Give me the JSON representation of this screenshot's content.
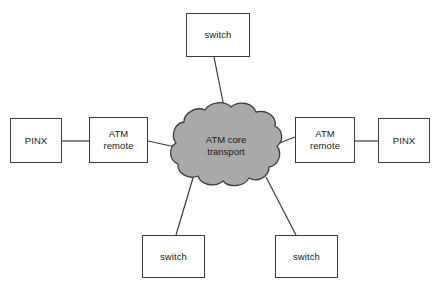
{
  "diagram": {
    "background_color": "#ffffff",
    "line_color": "#3a3a3a",
    "box_fill": "#ffffff",
    "cloud_fill": "#a9a9a9",
    "cloud_stroke": "#3c3c3c",
    "text_color": "#1a1a1a",
    "cloud": {
      "label": "ATM core\ntransport",
      "name": "atm-core-transport-cloud"
    },
    "nodes": [
      {
        "id": "switch-top",
        "label": "switch",
        "x": 186,
        "y": 13,
        "w": 64,
        "h": 44
      },
      {
        "id": "pinx-left",
        "label": "PINX",
        "x": 10,
        "y": 118,
        "w": 52,
        "h": 45
      },
      {
        "id": "atm-remote-left",
        "label": "ATM\nremote",
        "x": 89,
        "y": 117,
        "w": 59,
        "h": 46
      },
      {
        "id": "atm-remote-right",
        "label": "ATM\nremote",
        "x": 295,
        "y": 117,
        "w": 60,
        "h": 46
      },
      {
        "id": "pinx-right",
        "label": "PINX",
        "x": 378,
        "y": 118,
        "w": 52,
        "h": 45
      },
      {
        "id": "switch-bottom-left",
        "label": "switch",
        "x": 142,
        "y": 235,
        "w": 63,
        "h": 43
      },
      {
        "id": "switch-bottom-right",
        "label": "switch",
        "x": 275,
        "y": 235,
        "w": 63,
        "h": 43
      }
    ],
    "edges": [
      {
        "id": "edge-pinx-left-to-atm-remote-left",
        "from": "pinx-left",
        "to": "atm-remote-left",
        "x1": 62,
        "y1": 141,
        "x2": 89,
        "y2": 141
      },
      {
        "id": "edge-atm-remote-left-to-cloud",
        "from": "atm-remote-left",
        "to": "cloud",
        "x1": 148,
        "y1": 141,
        "x2": 180,
        "y2": 148
      },
      {
        "id": "edge-cloud-to-atm-remote-right",
        "from": "cloud",
        "to": "atm-remote-right",
        "x1": 272,
        "y1": 146,
        "x2": 295,
        "y2": 137
      },
      {
        "id": "edge-atm-remote-right-to-pinx-right",
        "from": "atm-remote-right",
        "to": "pinx-right",
        "x1": 355,
        "y1": 141,
        "x2": 378,
        "y2": 141
      },
      {
        "id": "edge-switch-top-to-cloud",
        "from": "switch-top",
        "to": "cloud",
        "x1": 214,
        "y1": 57,
        "x2": 226,
        "y2": 117
      },
      {
        "id": "edge-cloud-to-switch-bottom-left",
        "from": "cloud",
        "to": "switch-bottom-left",
        "x1": 193,
        "y1": 178,
        "x2": 176,
        "y2": 235
      },
      {
        "id": "edge-cloud-to-switch-bottom-right",
        "from": "cloud",
        "to": "switch-bottom-right",
        "x1": 266,
        "y1": 177,
        "x2": 296,
        "y2": 235
      }
    ]
  }
}
